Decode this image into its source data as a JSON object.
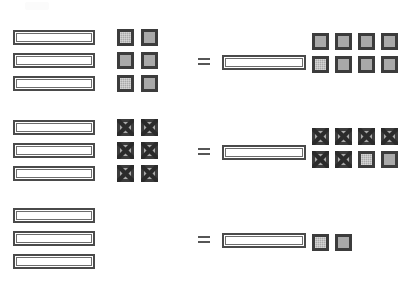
{
  "page": {
    "background_color": "#ffffff",
    "width": 401,
    "height": 288
  },
  "style": {
    "bar_fill": "#ffffff",
    "bar_border": "#4a4a4a",
    "square_fill": "#a9a9a9",
    "square_border": "#3c3c3c",
    "cross_color": "#2b2b2b",
    "equals_color": "#565656"
  },
  "legend": {
    "bar_name": "ten-rod",
    "square_name": "unit-cube",
    "crossed_square_name": "crossed-out-unit-cube",
    "equals_symbol": "="
  },
  "problems": [
    {
      "id": "problem-1",
      "left": {
        "bars": 3,
        "squares": 6,
        "squares_crossed": 0,
        "square_rows": [
          2,
          2,
          2
        ],
        "value": 36
      },
      "operator": "=",
      "right": {
        "bars": 1,
        "squares": 8,
        "squares_crossed": 0,
        "square_rows": [
          4,
          4
        ],
        "value": 18
      }
    },
    {
      "id": "problem-2",
      "left": {
        "bars": 3,
        "squares": 6,
        "squares_crossed": 6,
        "square_rows": [
          2,
          2,
          2
        ],
        "value": 36
      },
      "operator": "=",
      "right": {
        "bars": 1,
        "squares": 8,
        "squares_crossed": 6,
        "square_rows": [
          4,
          4
        ],
        "value": 18
      }
    },
    {
      "id": "problem-3",
      "left": {
        "bars": 3,
        "squares": 0,
        "squares_crossed": 0,
        "square_rows": [],
        "value": 30
      },
      "operator": "=",
      "right": {
        "bars": 1,
        "squares": 2,
        "squares_crossed": 0,
        "square_rows": [
          2
        ],
        "value": 12
      }
    }
  ],
  "geometry": {
    "left_bar": {
      "x": 13,
      "width": 82,
      "height": 15
    },
    "right_bar": {
      "x": 222,
      "width": 84,
      "height": 15
    },
    "left_bar_rows": [
      [
        30,
        53,
        76
      ],
      [
        120,
        143,
        166
      ],
      [
        208,
        231,
        254
      ]
    ],
    "left_square_origin": {
      "x": 117,
      "step_x": 24
    },
    "left_square_rows": [
      [
        29,
        52,
        75
      ],
      [
        119,
        142,
        165
      ],
      []
    ],
    "right_square_origin": {
      "x": 312,
      "step_x": 23
    },
    "right_square_rows": [
      [
        33,
        56
      ],
      [
        128,
        151
      ],
      [
        234
      ]
    ],
    "equals": [
      {
        "x": 198,
        "y": 58
      },
      {
        "x": 198,
        "y": 148
      },
      {
        "x": 198,
        "y": 236
      }
    ]
  }
}
